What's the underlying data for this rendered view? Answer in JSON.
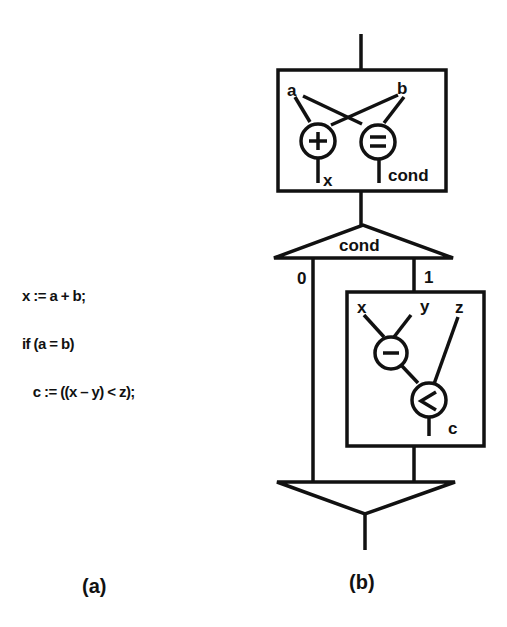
{
  "code": {
    "lines": [
      "x := a + b;",
      "if (a = b)",
      "   c := ((x – y) < z);"
    ]
  },
  "captions": {
    "a": "(a)",
    "b": "(b)"
  },
  "diagram": {
    "top_box": {
      "inputs": [
        "a",
        "b"
      ],
      "ops": [
        "+",
        "="
      ],
      "outputs": [
        "x",
        "cond"
      ]
    },
    "switch": {
      "label": "cond",
      "branch_false": "0",
      "branch_true": "1"
    },
    "inner_box": {
      "inputs": [
        "x",
        "y",
        "z"
      ],
      "ops": [
        "−",
        "<"
      ],
      "output": "c"
    }
  }
}
